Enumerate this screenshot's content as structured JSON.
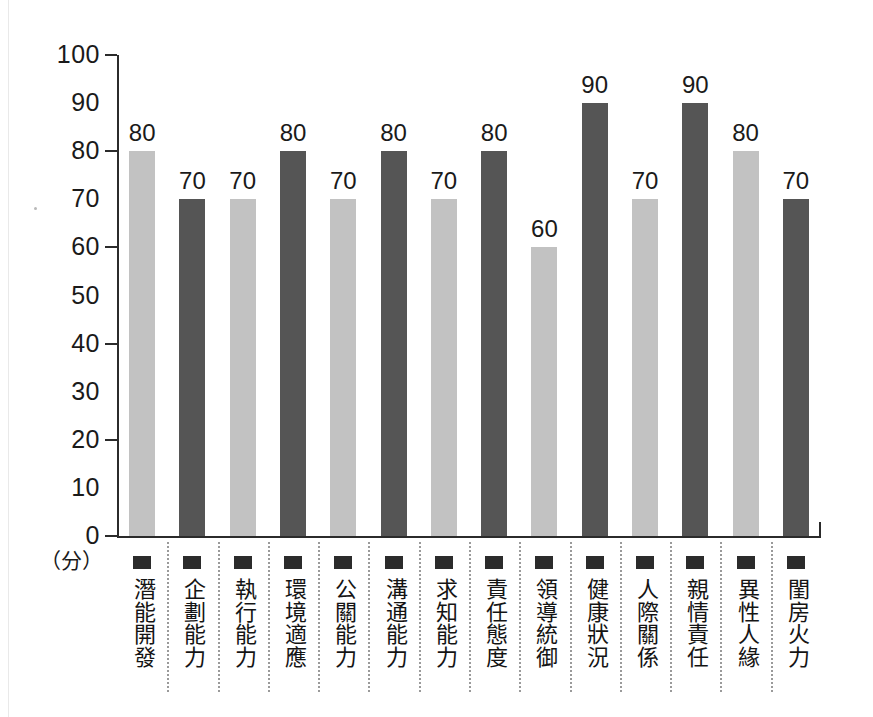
{
  "chart_data": {
    "type": "bar",
    "title": "",
    "subtitle": "",
    "xlabel": "",
    "ylabel": "",
    "y_unit_label": "（分）",
    "ylim": [
      0,
      100
    ],
    "y_ticks": [
      0,
      10,
      20,
      30,
      40,
      50,
      60,
      70,
      80,
      90,
      100
    ],
    "y_major_ticks": [
      0,
      20,
      40,
      60,
      80,
      100
    ],
    "grid": false,
    "legend": null,
    "categories": [
      "潛能開發",
      "企劃能力",
      "執行能力",
      "環境適應",
      "公關能力",
      "溝通能力",
      "求知能力",
      "責任態度",
      "領導統御",
      "健康狀況",
      "人際關係",
      "親情責任",
      "異性人緣",
      "閨房火力"
    ],
    "values": [
      80,
      70,
      70,
      80,
      70,
      80,
      70,
      80,
      60,
      90,
      70,
      90,
      80,
      70
    ],
    "bar_colors": [
      "light",
      "dark",
      "light",
      "dark",
      "light",
      "dark",
      "light",
      "dark",
      "light",
      "dark",
      "light",
      "dark",
      "light",
      "dark"
    ],
    "data_labels": [
      "80",
      "70",
      "70",
      "80",
      "70",
      "80",
      "70",
      "80",
      "60",
      "90",
      "70",
      "90",
      "80",
      "70"
    ]
  },
  "colors": {
    "bar_light": "#c2c2c2",
    "bar_dark": "#555555",
    "axis": "#2b2b2b",
    "text": "#1a1a1a",
    "separator": "#9a9a9a",
    "background": "#ffffff"
  }
}
